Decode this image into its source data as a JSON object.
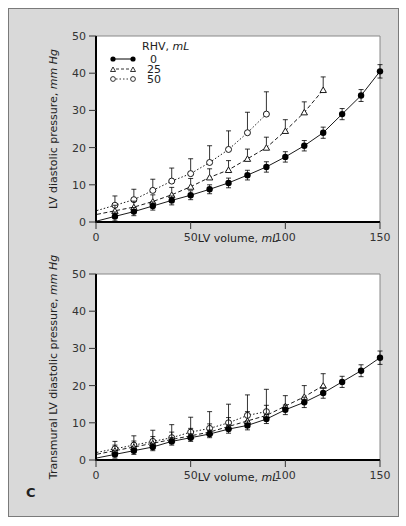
{
  "panel_label": "C",
  "legend": {
    "title": "RHV, ",
    "title_unit": "mL",
    "entries": [
      {
        "label": "0",
        "marker": "filled-circle",
        "line": "solid"
      },
      {
        "label": "25",
        "marker": "open-triangle",
        "line": "dashed"
      },
      {
        "label": "50",
        "marker": "open-circle",
        "line": "dotted"
      }
    ]
  },
  "chart_data": [
    {
      "type": "line",
      "title": "",
      "xlabel": "LV volume, mL",
      "xlabel_text": "LV volume, ",
      "xlabel_unit": "mL",
      "ylabel": "LV diastolic pressure, mm Hg",
      "ylabel_text": "LV diastolic pressure, ",
      "ylabel_unit": "mm Hg",
      "xlim": [
        0,
        150
      ],
      "ylim": [
        0,
        50
      ],
      "xticks": [
        0,
        50,
        100,
        150
      ],
      "yticks": [
        0,
        10,
        20,
        30,
        40,
        50
      ],
      "grid": false,
      "legend_position": "upper left",
      "series": [
        {
          "name": "RHV 0 mL",
          "x": [
            10,
            20,
            30,
            40,
            50,
            60,
            70,
            80,
            90,
            100,
            110,
            120,
            130,
            140,
            150
          ],
          "values": [
            1.5,
            2.8,
            4.3,
            5.8,
            7.2,
            8.8,
            10.5,
            12.6,
            14.8,
            17.5,
            20.5,
            24,
            29,
            34,
            40.5
          ],
          "err": [
            1.2,
            1.1,
            1.1,
            1.2,
            1.2,
            1.2,
            1.3,
            1.3,
            1.4,
            1.4,
            1.4,
            1.5,
            1.5,
            1.6,
            1.8
          ]
        },
        {
          "name": "RHV 25 mL",
          "x": [
            10,
            20,
            30,
            40,
            50,
            60,
            70,
            80,
            90,
            100,
            110,
            120
          ],
          "values": [
            3,
            4,
            5.5,
            7.3,
            9.5,
            12,
            14,
            17,
            20,
            24.5,
            29.5,
            35.5
          ],
          "err": [
            1.5,
            1.6,
            1.8,
            2,
            2.2,
            2.3,
            2.5,
            2.6,
            2.8,
            3,
            2.8,
            3.5
          ]
        },
        {
          "name": "RHV 50 mL",
          "x": [
            10,
            20,
            30,
            40,
            50,
            60,
            70,
            80,
            90
          ],
          "values": [
            4.5,
            6,
            8.5,
            11,
            13,
            16,
            19.5,
            24,
            29
          ],
          "err": [
            2.5,
            2.8,
            3,
            3.5,
            4,
            4.5,
            5,
            5.5,
            6
          ]
        }
      ]
    },
    {
      "type": "line",
      "title": "",
      "xlabel": "LV volume, mL",
      "xlabel_text": "LV volume, ",
      "xlabel_unit": "mL",
      "ylabel": "Transmural LV diastolic pressure, mm Hg",
      "ylabel_text": "Transmural LV diastolic pressure, ",
      "ylabel_unit": "mm Hg",
      "xlim": [
        0,
        150
      ],
      "ylim": [
        0,
        50
      ],
      "xticks": [
        0,
        50,
        100,
        150
      ],
      "yticks": [
        0,
        10,
        20,
        30,
        40,
        50
      ],
      "grid": false,
      "series": [
        {
          "name": "RHV 0 mL",
          "x": [
            10,
            20,
            30,
            40,
            50,
            60,
            70,
            80,
            90,
            100,
            110,
            120,
            130,
            140,
            150
          ],
          "values": [
            1.5,
            2.5,
            3.5,
            5,
            6,
            7,
            8.3,
            9.3,
            11,
            13.5,
            15.5,
            18,
            21,
            24,
            27.5
          ],
          "err": [
            1,
            1,
            1,
            1,
            1,
            1,
            1.1,
            1.2,
            1.2,
            1.3,
            1.4,
            1.4,
            1.5,
            1.6,
            1.8
          ]
        },
        {
          "name": "RHV 25 mL",
          "x": [
            10,
            20,
            30,
            40,
            50,
            60,
            70,
            80,
            90,
            100,
            110,
            120
          ],
          "values": [
            2.5,
            3.5,
            4.5,
            5.5,
            6.5,
            7.5,
            9,
            10.5,
            12,
            14.5,
            17,
            20
          ],
          "err": [
            1.5,
            1.6,
            1.8,
            2,
            2,
            2.2,
            2.4,
            2.5,
            2.7,
            2.8,
            3,
            3.2
          ]
        },
        {
          "name": "RHV 50 mL",
          "x": [
            10,
            20,
            30,
            40,
            50,
            60,
            70,
            80,
            90
          ],
          "values": [
            3,
            4,
            5,
            6,
            7.5,
            8.5,
            10,
            12,
            13
          ],
          "err": [
            2,
            2.5,
            3,
            3.5,
            4,
            4.5,
            5,
            5.5,
            6
          ]
        }
      ]
    }
  ]
}
